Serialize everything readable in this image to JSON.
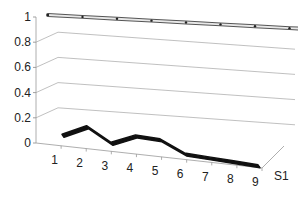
{
  "chart_data": {
    "type": "line",
    "subtype": "3d-line",
    "title": "",
    "xlabel": "",
    "ylabel": "",
    "categories": [
      "1",
      "2",
      "3",
      "4",
      "5",
      "6",
      "7",
      "8",
      "9"
    ],
    "series": [
      {
        "name": "S1",
        "values": [
          0.06,
          0.15,
          0.04,
          0.12,
          0.11,
          0.02,
          0.01,
          0.0,
          -0.01
        ],
        "color": "#111111"
      },
      {
        "name": "top-ribbon",
        "values": [
          1,
          1,
          1,
          1,
          1,
          1,
          1,
          1,
          1
        ],
        "color": "#cccccc"
      }
    ],
    "yticks": [
      "0",
      "0.2",
      "0.4",
      "0.6",
      "0.8",
      "1"
    ],
    "ylim": [
      0,
      1
    ],
    "depth_label": "S1",
    "grid": true,
    "legend": "none"
  }
}
